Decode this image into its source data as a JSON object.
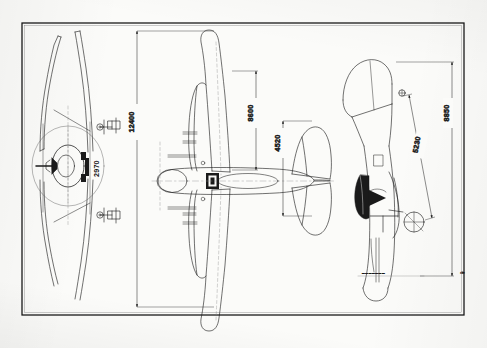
{
  "sheet": {
    "title": "Aircraft three-view general arrangement drawing",
    "background_color": "#fbfbf9",
    "line_color": "#1a1a1a",
    "border_color": "#111111",
    "units_note": "mm"
  },
  "views": [
    {
      "id": "front-view",
      "name": "Front elevation view",
      "position": "left",
      "description": "Head-on view showing gull wing, radial cowling, propeller hub and main landing gear"
    },
    {
      "id": "plan-view",
      "name": "Plan (top) view",
      "position": "center",
      "description": "Top-down view showing wing planform, fuselage, tailplane and elevators"
    },
    {
      "id": "side-view",
      "name": "Side elevation view",
      "position": "right",
      "description": "Profile view showing fuselage, canopy, fin, rudder and undercarriage"
    }
  ],
  "dimensions": [
    {
      "id": "wingspan",
      "value": "12400",
      "view": "plan-view",
      "orientation": "vertical",
      "meaning": "Overall wing span"
    },
    {
      "id": "overall-length",
      "value": "8600",
      "view": "plan-view",
      "orientation": "vertical",
      "meaning": "Overall fuselage length"
    },
    {
      "id": "tailplane-span",
      "value": "4520",
      "view": "plan-view",
      "orientation": "vertical",
      "meaning": "Horizontal tailplane span"
    },
    {
      "id": "track-width",
      "value": "2970",
      "view": "front-view",
      "orientation": "vertical",
      "meaning": "Main undercarriage track"
    },
    {
      "id": "side-overall-length",
      "value": "8850",
      "view": "side-view",
      "orientation": "vertical",
      "meaning": "Overall length in side elevation"
    },
    {
      "id": "datum-height",
      "value": "5230",
      "view": "side-view",
      "orientation": "diagonal",
      "meaning": "Height to datum / ground clearance reference"
    }
  ],
  "annotations": {
    "corner_mark": "✑",
    "caption_hint": "scale note"
  }
}
